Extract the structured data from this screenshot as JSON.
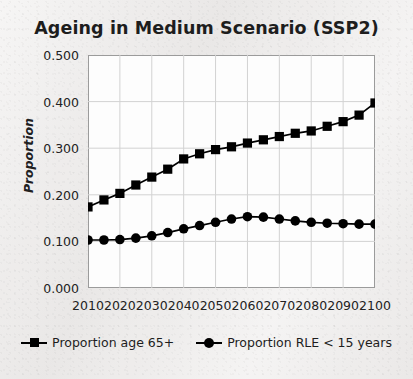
{
  "chart_data": {
    "type": "line",
    "title": "Ageing in Medium Scenario (SSP2)",
    "xlabel": "",
    "ylabel": "Proportion",
    "xlim": [
      2010,
      2100
    ],
    "ylim": [
      0.0,
      0.5
    ],
    "grid": true,
    "legend_position": "bottom",
    "x_tick_labels": [
      "2010",
      "2020",
      "2030",
      "2040",
      "2050",
      "2060",
      "2070",
      "2080",
      "2090",
      "2100"
    ],
    "y_tick_labels": [
      "0.000",
      "0.100",
      "0.200",
      "0.300",
      "0.400",
      "0.500"
    ],
    "x_ticks": [
      2010,
      2020,
      2030,
      2040,
      2050,
      2060,
      2070,
      2080,
      2090,
      2100
    ],
    "y_ticks": [
      0.0,
      0.1,
      0.2,
      0.3,
      0.4,
      0.5
    ],
    "x": [
      2010,
      2015,
      2020,
      2025,
      2030,
      2035,
      2040,
      2045,
      2050,
      2055,
      2060,
      2065,
      2070,
      2075,
      2080,
      2085,
      2090,
      2095,
      2100
    ],
    "series": [
      {
        "name": "Proportion age 65+",
        "marker": "square",
        "color": "#000000",
        "values": [
          0.174,
          0.189,
          0.203,
          0.221,
          0.238,
          0.255,
          0.277,
          0.288,
          0.297,
          0.303,
          0.311,
          0.318,
          0.325,
          0.332,
          0.337,
          0.347,
          0.357,
          0.371,
          0.397
        ]
      },
      {
        "name": "Proportion RLE < 15 years",
        "marker": "circle",
        "color": "#000000",
        "values": [
          0.103,
          0.103,
          0.104,
          0.107,
          0.112,
          0.119,
          0.127,
          0.134,
          0.141,
          0.148,
          0.153,
          0.152,
          0.148,
          0.144,
          0.141,
          0.139,
          0.138,
          0.137,
          0.137
        ]
      }
    ]
  },
  "legend": {
    "entries": [
      {
        "label": "Proportion age 65+",
        "marker": "square"
      },
      {
        "label": "Proportion RLE < 15 years",
        "marker": "circle"
      }
    ]
  },
  "colors": {
    "series": "#000000",
    "grid": "#d2d2d2",
    "axis": "#9b9b9b",
    "plot_background": "#fdfdfd",
    "figure_background": "#eeeceb",
    "text": "#1d1d1d"
  }
}
